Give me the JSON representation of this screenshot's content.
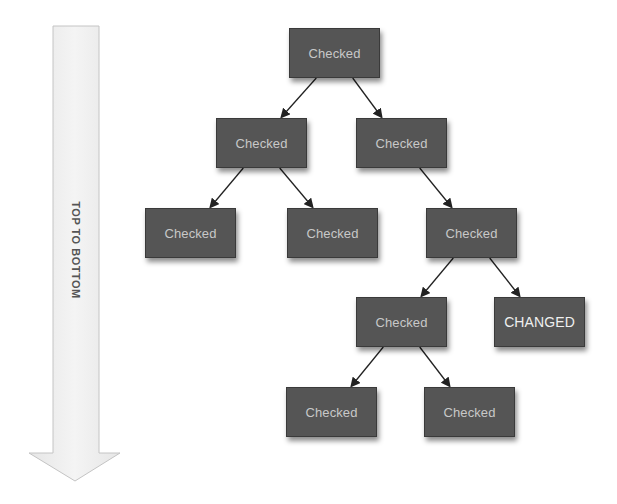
{
  "direction_arrow": {
    "label": "TOP TO BOTTOM",
    "fill": "#efefef",
    "stroke": "#c8c8c8"
  },
  "colors": {
    "node_fill": "#555555",
    "node_text": "#c8c8c8",
    "changed_text": "#efefef",
    "edge": "#222222"
  },
  "nodes": [
    {
      "id": "root",
      "label": "Checked",
      "x": 289,
      "y": 28
    },
    {
      "id": "l2a",
      "label": "Checked",
      "x": 216,
      "y": 118
    },
    {
      "id": "l2b",
      "label": "Checked",
      "x": 356,
      "y": 118
    },
    {
      "id": "l3a",
      "label": "Checked",
      "x": 145,
      "y": 208
    },
    {
      "id": "l3b",
      "label": "Checked",
      "x": 287,
      "y": 208
    },
    {
      "id": "l3c",
      "label": "Checked",
      "x": 426,
      "y": 208
    },
    {
      "id": "l4a",
      "label": "Checked",
      "x": 356,
      "y": 297
    },
    {
      "id": "l4b",
      "label": "CHANGED",
      "x": 494,
      "y": 297
    },
    {
      "id": "l5a",
      "label": "Checked",
      "x": 286,
      "y": 387
    },
    {
      "id": "l5b",
      "label": "Checked",
      "x": 424,
      "y": 387
    }
  ],
  "edges": [
    {
      "from": "root",
      "to": "l2a"
    },
    {
      "from": "root",
      "to": "l2b"
    },
    {
      "from": "l2a",
      "to": "l3a"
    },
    {
      "from": "l2a",
      "to": "l3b"
    },
    {
      "from": "l2b",
      "to": "l3c"
    },
    {
      "from": "l3c",
      "to": "l4a"
    },
    {
      "from": "l3c",
      "to": "l4b"
    },
    {
      "from": "l4a",
      "to": "l5a"
    },
    {
      "from": "l4a",
      "to": "l5b"
    }
  ]
}
